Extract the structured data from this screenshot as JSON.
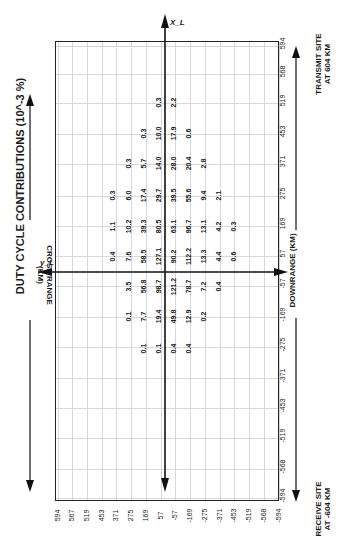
{
  "chart_data": {
    "type": "table",
    "title": "DUTY CYCLE CONTRIBUTIONS (10^-3 %)",
    "xlabel": "DOWNRANGE (KM)",
    "ylabel": "CROSS RANGE (KM)",
    "axis_x_label": "X_L",
    "axis_y_label": "y_L",
    "transmit_label": [
      "TRANSMIT SITE",
      "AT 604 KM"
    ],
    "receive_label": [
      "RECEIVE SITE",
      "AT -604 KM"
    ],
    "downrange_ticks": [
      "594",
      "568",
      "519",
      "453",
      "371",
      "275",
      "169",
      "57",
      "-57",
      "-169",
      "-275",
      "-371",
      "-453",
      "-519",
      "-568",
      "-594"
    ],
    "crossrange_ticks": [
      "594",
      "567",
      "519",
      "453",
      "371",
      "275",
      "169",
      "57",
      "-57",
      "-169",
      "-275",
      "-371",
      "-453",
      "-519",
      "-568",
      "-594"
    ],
    "rows": [
      {
        "y": 104,
        "cells": [
          {
            "x": 158,
            "v": "0.3"
          },
          {
            "x": 173,
            "v": "2.2"
          }
        ]
      },
      {
        "y": 135,
        "cells": [
          {
            "x": 143,
            "v": "0.3"
          },
          {
            "x": 158,
            "v": "10.0"
          },
          {
            "x": 173,
            "v": "17.9"
          },
          {
            "x": 188,
            "v": "0.6"
          }
        ]
      },
      {
        "y": 165,
        "cells": [
          {
            "x": 128,
            "v": "0.3"
          },
          {
            "x": 143,
            "v": "5.7"
          },
          {
            "x": 158,
            "v": "14.0"
          },
          {
            "x": 173,
            "v": "28.0"
          },
          {
            "x": 188,
            "v": "20.4"
          },
          {
            "x": 203,
            "v": "2.8"
          }
        ]
      },
      {
        "y": 197,
        "cells": [
          {
            "x": 112,
            "v": "0.3"
          },
          {
            "x": 128,
            "v": "6.0"
          },
          {
            "x": 143,
            "v": "17.4"
          },
          {
            "x": 158,
            "v": "29.7"
          },
          {
            "x": 173,
            "v": "39.5"
          },
          {
            "x": 188,
            "v": "55.6"
          },
          {
            "x": 203,
            "v": "9.4"
          },
          {
            "x": 218,
            "v": "2.1"
          }
        ]
      },
      {
        "y": 228,
        "cells": [
          {
            "x": 112,
            "v": "1.1"
          },
          {
            "x": 128,
            "v": "10.2"
          },
          {
            "x": 143,
            "v": "39.3"
          },
          {
            "x": 158,
            "v": "80.5"
          },
          {
            "x": 173,
            "v": "63.1"
          },
          {
            "x": 188,
            "v": "96.7"
          },
          {
            "x": 203,
            "v": "13.1"
          },
          {
            "x": 218,
            "v": "4.2"
          },
          {
            "x": 233,
            "v": "0.3"
          }
        ]
      },
      {
        "y": 258,
        "cells": [
          {
            "x": 112,
            "v": "0.4"
          },
          {
            "x": 128,
            "v": "7.6"
          },
          {
            "x": 143,
            "v": "58.5"
          },
          {
            "x": 158,
            "v": "127.1"
          },
          {
            "x": 173,
            "v": "90.2"
          },
          {
            "x": 188,
            "v": "112.2"
          },
          {
            "x": 203,
            "v": "13.3"
          },
          {
            "x": 218,
            "v": "4.4"
          },
          {
            "x": 233,
            "v": "0.6"
          }
        ]
      },
      {
        "y": 288,
        "cells": [
          {
            "x": 128,
            "v": "3.5"
          },
          {
            "x": 143,
            "v": "56.8"
          },
          {
            "x": 158,
            "v": "98.7"
          },
          {
            "x": 173,
            "v": "121.2"
          },
          {
            "x": 188,
            "v": "78.7"
          },
          {
            "x": 203,
            "v": "7.2"
          },
          {
            "x": 218,
            "v": "0.4"
          }
        ]
      },
      {
        "y": 318,
        "cells": [
          {
            "x": 128,
            "v": "0.1"
          },
          {
            "x": 143,
            "v": "7.7"
          },
          {
            "x": 158,
            "v": "19.4"
          },
          {
            "x": 173,
            "v": "49.8"
          },
          {
            "x": 188,
            "v": "12.9"
          },
          {
            "x": 203,
            "v": "0.2"
          }
        ]
      },
      {
        "y": 350,
        "cells": [
          {
            "x": 143,
            "v": "0.1"
          },
          {
            "x": 158,
            "v": "0.1"
          },
          {
            "x": 173,
            "v": "0.4"
          },
          {
            "x": 188,
            "v": "0.4"
          }
        ]
      }
    ]
  }
}
